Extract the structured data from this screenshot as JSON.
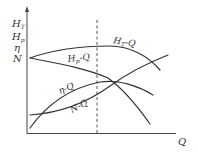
{
  "figure": {
    "type": "pump characteristic curves",
    "y_axis_labels": [
      {
        "main": "H",
        "sub": "T"
      },
      {
        "main": "H",
        "sub": "p"
      },
      {
        "main": "η",
        "sub": ""
      },
      {
        "main": "N",
        "sub": ""
      }
    ],
    "x_axis_label": "Q",
    "curves": [
      {
        "name": "H_T-Q",
        "main": "H",
        "sub": "T",
        "suffix": "-Q"
      },
      {
        "name": "H_p-Q",
        "main": "H",
        "sub": "p",
        "suffix": "-Q"
      },
      {
        "name": "η-Q",
        "label": "η-Q"
      },
      {
        "name": "N-Q",
        "label": "N-Q"
      }
    ],
    "has_dashed_design_point_line": true,
    "colors": {
      "line": "#333333",
      "background": "#ffffff"
    }
  }
}
